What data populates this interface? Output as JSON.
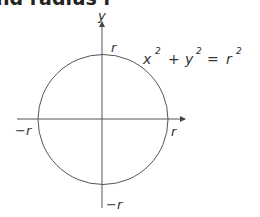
{
  "heading": "nd radius r",
  "diagram": {
    "axis_labels": {
      "y": "y"
    },
    "point_labels": {
      "top": "r",
      "right": "r",
      "left": "−r",
      "bottom": "−r"
    },
    "equation": {
      "x": "x",
      "x_exp": "2",
      "plus": "+",
      "y": "y",
      "y_exp": "2",
      "equals": "=",
      "r": "r",
      "r_exp": "2"
    },
    "stroke_color": "#555555",
    "text_color": "#333333"
  }
}
